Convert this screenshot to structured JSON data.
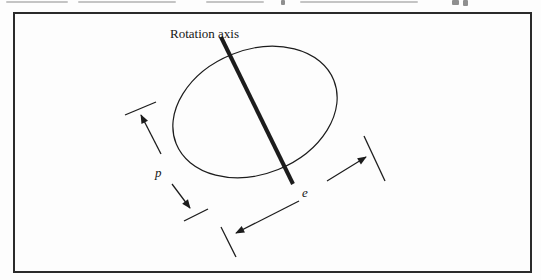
{
  "figure": {
    "rotation_axis_label": "Rotation axis",
    "p_label": "p",
    "e_label": "e"
  },
  "colors": {
    "line": "#1c1c1c",
    "frame_border": "#2b2b2b",
    "background": "#fdfdfd",
    "cropped_text_remnant": "#9a9a9a"
  }
}
